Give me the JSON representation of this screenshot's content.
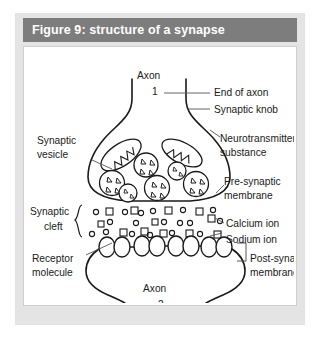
{
  "figure": {
    "header_title": "Figure 9: structure of a synapse",
    "header_bg": "#7d7d7d",
    "header_text_color": "#ffffff",
    "card_bg": "#e4e4e4",
    "panel_bg": "#ffffff",
    "ink_color": "#1a1a1a"
  },
  "diagram": {
    "type": "biological-diagram",
    "labels": {
      "axon_1_name": "Axon",
      "axon_1_number": "1",
      "end_of_axon": "End of axon",
      "synaptic_knob": "Synaptic knob",
      "synaptic_vesicle_line1": "Synaptic",
      "synaptic_vesicle_line2": "vesicle",
      "neurotransmitter_line1": "Neurotransmitter",
      "neurotransmitter_line2": "substance",
      "presynaptic_membrane_line1": "Pre-synaptic",
      "presynaptic_membrane_line2": "membrane",
      "synaptic_cleft_line1": "Synaptic",
      "synaptic_cleft_line2": "cleft",
      "calcium_ion": "Calcium ion",
      "sodium_ion": "Sodium ion",
      "receptor_molecule_line1": "Receptor",
      "receptor_molecule_line2": "molecule",
      "postsynaptic_membrane_line1": "Post-synaptic",
      "postsynaptic_membrane_line2": "membrane",
      "axon_2_name": "Axon",
      "axon_2_number": "2"
    },
    "structures": {
      "mitochondria_count": 2,
      "vesicle_count": 6,
      "vesicle_triangles_each": 4,
      "receptor_pair_count": 4,
      "cleft_circle_ions": 18,
      "cleft_square_ions": 12
    }
  }
}
